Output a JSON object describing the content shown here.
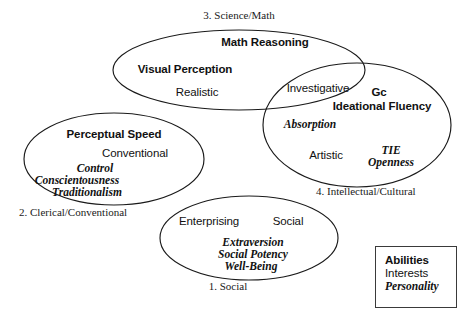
{
  "figure": {
    "title": "",
    "type": "venn-diagram",
    "background_color": "#ffffff",
    "stroke_color": "#1a1a1a"
  },
  "circles": {
    "science_math": {
      "group_label": "3. Science/Math",
      "items": [
        {
          "text": "Math Reasoning",
          "category": "ability"
        },
        {
          "text": "Visual Perception",
          "category": "ability"
        },
        {
          "text": "Realistic",
          "category": "interest"
        }
      ]
    },
    "intellectual_cultural": {
      "group_label": "4. Intellectual/Cultural",
      "items": [
        {
          "text": "Investigative",
          "category": "interest"
        },
        {
          "text": "Gc",
          "category": "ability"
        },
        {
          "text": "Ideational Fluency",
          "category": "ability"
        },
        {
          "text": "Absorption",
          "category": "personality"
        },
        {
          "text": "Artistic",
          "category": "interest"
        },
        {
          "text": "TIE",
          "category": "personality"
        },
        {
          "text": "Openness",
          "category": "personality"
        }
      ]
    },
    "clerical_conventional": {
      "group_label": "2. Clerical/Conventional",
      "items": [
        {
          "text": "Perceptual Speed",
          "category": "ability"
        },
        {
          "text": "Conventional",
          "category": "interest"
        },
        {
          "text": "Control",
          "category": "personality"
        },
        {
          "text": "Conscientousness",
          "category": "personality"
        },
        {
          "text": "Traditionalism",
          "category": "personality"
        }
      ]
    },
    "social": {
      "group_label": "1. Social",
      "items": [
        {
          "text": "Enterprising",
          "category": "interest"
        },
        {
          "text": "Social",
          "category": "interest"
        },
        {
          "text": "Extraversion",
          "category": "personality"
        },
        {
          "text": "Social Potency",
          "category": "personality"
        },
        {
          "text": "Well-Being",
          "category": "personality"
        }
      ]
    }
  },
  "legend": {
    "rows": [
      {
        "text": "Abilities",
        "category": "ability"
      },
      {
        "text": "Interests",
        "category": "interest"
      },
      {
        "text": "Personality",
        "category": "personality"
      }
    ]
  }
}
